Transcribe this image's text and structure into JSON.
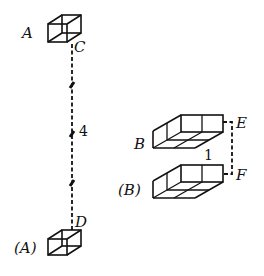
{
  "figure": {
    "left_part": {
      "top_label": "A",
      "top_point_label": "C",
      "bottom_label": "(A)",
      "bottom_point_label": "D",
      "distance_label": "4",
      "tick_count": 3
    },
    "right_part": {
      "top_label": "B",
      "top_point_label": "E",
      "bottom_label": "(B)",
      "bottom_point_label": "F",
      "distance_label": "1"
    },
    "colors": {
      "line": "#111111",
      "background": "#ffffff"
    }
  }
}
